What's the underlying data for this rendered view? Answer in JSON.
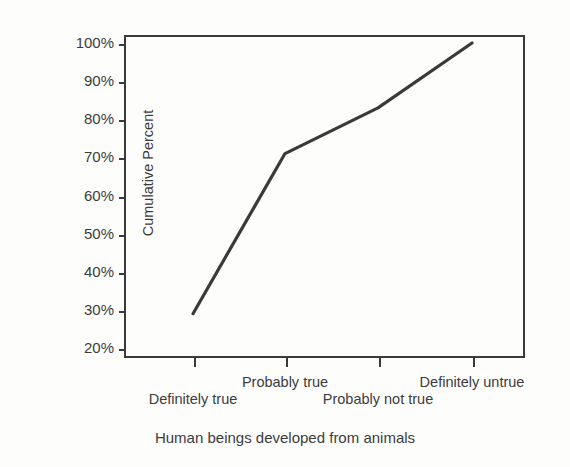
{
  "chart_data": {
    "type": "line",
    "title": "",
    "xlabel": "Human beings developed from animals",
    "ylabel": "Cumulative Percent",
    "categories": [
      "Definitely true",
      "Probably true",
      "Probably not true",
      "Definitely untrue"
    ],
    "values": [
      29,
      71,
      83,
      100
    ],
    "series": [
      {
        "name": "Cumulative Percent",
        "values": [
          29,
          71,
          83,
          100
        ]
      }
    ],
    "ylim": [
      20,
      100
    ],
    "ytick_labels": [
      "100%",
      "90%",
      "80%",
      "70%",
      "60%",
      "50%",
      "40%",
      "30%",
      "20%"
    ],
    "ytick_values": [
      100,
      90,
      80,
      70,
      60,
      50,
      40,
      30,
      20
    ],
    "grid": false,
    "legend": false,
    "legend_position": "none",
    "line_color": "#3a3a3a",
    "axis_color": "#3a3a3a",
    "background_color": "#fdfdfc",
    "x_label_layout": "staggered-two-row",
    "x_labels_upper_row": [
      "Probably true",
      "Definitely untrue"
    ],
    "x_labels_lower_row": [
      "Definitely true",
      "Probably not true"
    ]
  }
}
